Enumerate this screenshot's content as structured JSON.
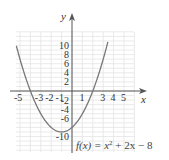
{
  "chart_data": {
    "type": "line",
    "title": "",
    "function_label": "f(x) = x² + 2x − 8",
    "function_label_parts": {
      "lhs": "f(x) = x",
      "exp": "2",
      "rhs": " + 2x − 8"
    },
    "xlabel": "x",
    "ylabel": "y",
    "xlim": [
      -5.5,
      7
    ],
    "ylim": [
      -12,
      14
    ],
    "x_ticks": [
      "-5",
      "-3",
      "-2",
      "-1",
      "1",
      "3",
      "4",
      "5"
    ],
    "x_tick_values": [
      -5,
      -3,
      -2,
      -1,
      1,
      3,
      4,
      5
    ],
    "y_ticks": [
      "10",
      "8",
      "6",
      "4",
      "2",
      "-2",
      "-4",
      "-6",
      "-10"
    ],
    "y_tick_values": [
      10,
      8,
      6,
      4,
      2,
      -2,
      -4,
      -6,
      -10
    ],
    "grid": true,
    "series": [
      {
        "name": "f(x) = x^2 + 2x - 8",
        "x": [
          -5.2,
          -5,
          -4.5,
          -4,
          -3.5,
          -3,
          -2.5,
          -2,
          -1.5,
          -1,
          -0.5,
          0,
          0.5,
          1,
          1.5,
          2,
          2.5,
          3,
          3.3
        ],
        "values": [
          8.64,
          7,
          3.25,
          0,
          -2.75,
          -5,
          -6.75,
          -8,
          -8.75,
          -9,
          -8.75,
          -8,
          -6.75,
          -5,
          -2.75,
          0,
          3.25,
          7,
          9.49
        ]
      }
    ],
    "vertex": [
      -1,
      -9
    ],
    "x_intercepts": [
      -4,
      2
    ],
    "y_intercept": -8
  },
  "colors": {
    "curve": "#777777",
    "axis": "#555555",
    "grid": "#e4e4e4",
    "text": "#333333"
  }
}
